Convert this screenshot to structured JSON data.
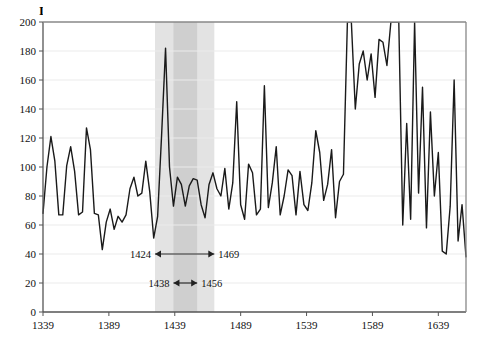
{
  "chart_data": {
    "type": "line",
    "title": "",
    "ylabel": "Index",
    "xlabel": "",
    "ylim": [
      0,
      200
    ],
    "xlim": [
      1339,
      1660
    ],
    "yticks": [
      0,
      20,
      40,
      60,
      80,
      100,
      120,
      140,
      160,
      180,
      200
    ],
    "xticks": [
      1339,
      1389,
      1439,
      1489,
      1539,
      1589,
      1639
    ],
    "grid": true,
    "legend": "none",
    "series_color": "#1a1a1a",
    "bands": [
      {
        "name": "outer-band",
        "from": 1424,
        "to": 1469,
        "color": "#e3e3e3"
      },
      {
        "name": "inner-band",
        "from": 1438,
        "to": 1456,
        "color": "#cfcfcf"
      }
    ],
    "annotations": [
      {
        "name": "outer-range",
        "left_label": "1424",
        "right_label": "1469",
        "from": 1424,
        "to": 1469,
        "y": 40
      },
      {
        "name": "inner-range",
        "left_label": "1438",
        "right_label": "1456",
        "from": 1438,
        "to": 1456,
        "y": 20
      }
    ],
    "x": [
      1339,
      1342,
      1345,
      1348,
      1351,
      1354,
      1357,
      1360,
      1363,
      1366,
      1369,
      1372,
      1375,
      1378,
      1381,
      1384,
      1387,
      1390,
      1393,
      1396,
      1399,
      1402,
      1405,
      1408,
      1411,
      1414,
      1417,
      1420,
      1423,
      1426,
      1429,
      1432,
      1435,
      1438,
      1441,
      1444,
      1447,
      1450,
      1453,
      1456,
      1459,
      1462,
      1465,
      1468,
      1471,
      1474,
      1477,
      1480,
      1483,
      1486,
      1489,
      1492,
      1495,
      1498,
      1501,
      1504,
      1507,
      1510,
      1513,
      1516,
      1519,
      1522,
      1525,
      1528,
      1531,
      1534,
      1537,
      1540,
      1543,
      1546,
      1549,
      1552,
      1555,
      1558,
      1561,
      1564,
      1567,
      1570,
      1573,
      1576,
      1579,
      1582,
      1585,
      1588,
      1591,
      1594,
      1597,
      1600,
      1603,
      1606,
      1609,
      1612,
      1615,
      1618,
      1621,
      1624,
      1627,
      1630,
      1633,
      1636,
      1639,
      1642,
      1645,
      1648,
      1651,
      1654,
      1657,
      1660
    ],
    "y": [
      68,
      100,
      121,
      104,
      67,
      67,
      101,
      114,
      97,
      67,
      69,
      127,
      112,
      68,
      67,
      43,
      62,
      71,
      57,
      66,
      62,
      67,
      85,
      93,
      80,
      82,
      104,
      83,
      51,
      66,
      122,
      182,
      100,
      73,
      93,
      88,
      73,
      87,
      92,
      91,
      74,
      65,
      88,
      96,
      85,
      80,
      99,
      71,
      89,
      145,
      74,
      64,
      102,
      96,
      67,
      71,
      156,
      72,
      89,
      114,
      67,
      80,
      98,
      94,
      67,
      97,
      74,
      70,
      89,
      125,
      110,
      77,
      88,
      112,
      65,
      90,
      95,
      205,
      205,
      140,
      171,
      180,
      160,
      178,
      148,
      188,
      186,
      170,
      205,
      205,
      205,
      60,
      130,
      64,
      205,
      82,
      155,
      58,
      138,
      80,
      110,
      42,
      40,
      73,
      160,
      49,
      74,
      38
    ],
    "series_name": "Index"
  }
}
